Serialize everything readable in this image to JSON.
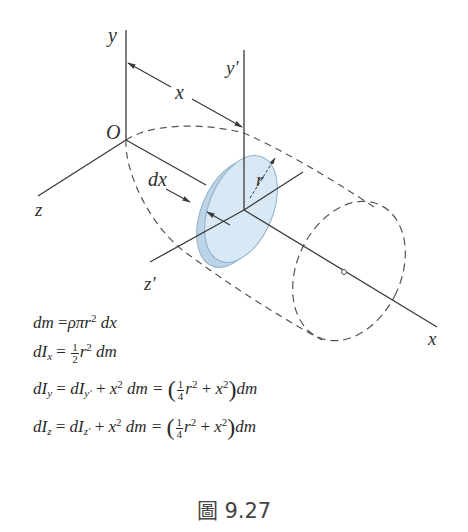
{
  "figure": {
    "caption": "圖 9.27",
    "labels": {
      "y_axis": "y",
      "y_prime_axis": "y′",
      "x_distance": "x",
      "origin": "O",
      "z_axis": "z",
      "dx": "dx",
      "radius": "r",
      "z_prime_axis": "z′",
      "x_axis": "x"
    },
    "colors": {
      "line": "#3a3a3a",
      "disk_fill": "#cfe2f0",
      "disk_edge": "#8fb0c8",
      "dashed": "#555555"
    }
  },
  "equations": [
    {
      "id": "dm",
      "text": "dm = ρπr² dx"
    },
    {
      "id": "dIx",
      "text": "dIx = ½ r² dm"
    },
    {
      "id": "dIy",
      "text": "dIy = dIy′ + x² dm = (¼ r² + x²) dm"
    },
    {
      "id": "dIz",
      "text": "dIz = dIz′ + x² dm = (¼ r² + x²) dm"
    }
  ],
  "equation_parts": {
    "dm": {
      "lhs": "dm",
      "eq": "=",
      "rhs": "ρπr",
      "exp": "2",
      "tail": " dx"
    },
    "dIx": {
      "d": "d",
      "I": "I",
      "sub": "x",
      "eq": " = ",
      "num": "1",
      "den": "2",
      "r": "r",
      "exp": "2",
      "tail": " dm"
    },
    "dIy": {
      "d": "d",
      "I": "I",
      "sub": "y",
      "eq": " = ",
      "d2": "d",
      "I2": "I",
      "sub2": "y′",
      "plus": " + ",
      "x": "x",
      "exp": "2",
      "dm": " dm = ",
      "lp": "(",
      "num": "1",
      "den": "4",
      "r": "r",
      "exp2": "2",
      "plus2": " + ",
      "x2": "x",
      "exp3": "2",
      "rp": ")",
      "tail": "dm"
    },
    "dIz": {
      "d": "d",
      "I": "I",
      "sub": "z",
      "eq": " = ",
      "d2": "d",
      "I2": "I",
      "sub2": "z′",
      "plus": " + ",
      "x": "x",
      "exp": "2",
      "dm": " dm = ",
      "lp": "(",
      "num": "1",
      "den": "4",
      "r": "r",
      "exp2": "2",
      "plus2": " + ",
      "x2": "x",
      "exp3": "2",
      "rp": ")",
      "tail": "dm"
    }
  }
}
